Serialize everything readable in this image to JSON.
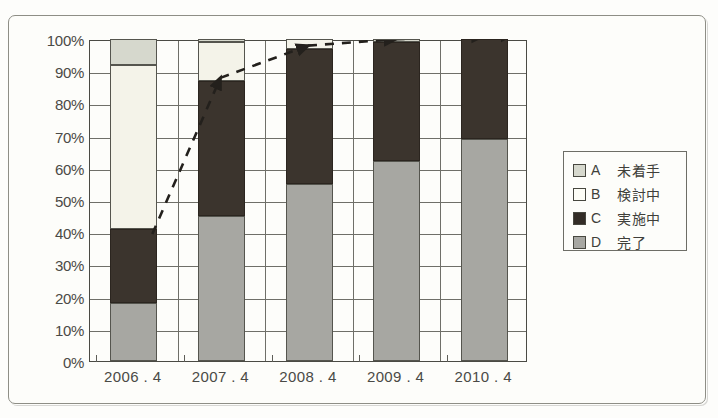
{
  "chart_data": {
    "type": "bar",
    "stacked": true,
    "stack_total": 100,
    "title": "",
    "subtitle": "",
    "xlabel": "",
    "ylabel": "",
    "ylim": [
      0,
      100
    ],
    "yticks": [
      "0%",
      "10%",
      "20%",
      "30%",
      "40%",
      "50%",
      "60%",
      "70%",
      "80%",
      "90%",
      "100%"
    ],
    "ytick_values": [
      0,
      10,
      20,
      30,
      40,
      50,
      60,
      70,
      80,
      90,
      100
    ],
    "grid": true,
    "grid_axis": "both",
    "legend_position": "right",
    "categories": [
      "2006.4",
      "2007.4",
      "2008.4",
      "2009.4",
      "2010.4"
    ],
    "series": [
      {
        "name": "D 完了",
        "key": "D",
        "label": "完了",
        "color": "#a7a7a2",
        "values": [
          18,
          45,
          55,
          62,
          69
        ]
      },
      {
        "name": "C 実施中",
        "key": "C",
        "label": "実施中",
        "color": "#3b342d",
        "values": [
          23,
          42,
          42,
          37,
          31
        ]
      },
      {
        "name": "B 検討中",
        "key": "B",
        "label": "検討中",
        "color": "#f4f3e9",
        "values": [
          51,
          12,
          3,
          0,
          0
        ]
      },
      {
        "name": "A 未着手",
        "key": "A",
        "label": "未着手",
        "color": "#d6d8cd",
        "values": [
          8,
          1,
          0,
          1,
          0
        ]
      }
    ],
    "cumulative_tops": {
      "D": [
        18,
        45,
        55,
        62,
        69
      ],
      "C": [
        41,
        87,
        97,
        99,
        100
      ],
      "B": [
        92,
        99,
        100,
        99,
        100
      ],
      "A": [
        100,
        100,
        100,
        100,
        100
      ]
    },
    "annotations": [
      {
        "type": "dashed-arrow",
        "description": "rising dashed trend arrow tracking the top of the 実施中 (C) segment",
        "points": [
          {
            "x_category": "2006.4",
            "value": 41
          },
          {
            "x_category": "2007.4",
            "value": 87
          },
          {
            "x_category": "2008.4",
            "value": 97
          },
          {
            "x_category": "2009.4",
            "value": 99
          },
          {
            "x_category": "2010.4",
            "value": 100
          }
        ]
      }
    ]
  },
  "axis": {
    "y_ticks": [
      "100%",
      "90%",
      "80%",
      "70%",
      "60%",
      "50%",
      "40%",
      "30%",
      "20%",
      "10%",
      "0%"
    ],
    "x_ticks": [
      "2006.4",
      "2007.4",
      "2008.4",
      "2009.4",
      "2010.4"
    ]
  },
  "legend": {
    "items": [
      {
        "key": "A",
        "label": "未着手",
        "swatch": "sw-A"
      },
      {
        "key": "B",
        "label": "検討中",
        "swatch": "sw-B"
      },
      {
        "key": "C",
        "label": "実施中",
        "swatch": "sw-C"
      },
      {
        "key": "D",
        "label": "完了",
        "swatch": "sw-D"
      }
    ]
  },
  "footnote": {
    "text": ""
  }
}
